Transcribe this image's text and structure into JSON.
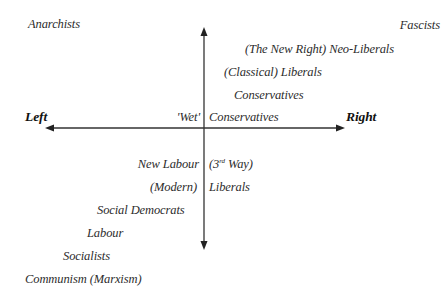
{
  "diagram": {
    "type": "political-spectrum-axes",
    "axes": {
      "horizontal": {
        "left_label": "Left",
        "right_label": "Right",
        "y": 128,
        "x_start": 45,
        "x_end": 345
      },
      "vertical": {
        "x": 204,
        "y_start": 27,
        "y_end": 250
      }
    },
    "corner_labels": {
      "top_left": "Anarchists",
      "top_right": "Fascists"
    },
    "right_side_labels": [
      {
        "text": "(The New Right) Neo-Liberals"
      },
      {
        "text": "(Classical) Liberals"
      },
      {
        "text": "Conservatives"
      }
    ],
    "center_labels": {
      "wet_left": "'Wet'",
      "wet_right": "Conservatives",
      "new_labour_left": "New Labour",
      "third_way_open": "(3",
      "third_way_sup": "rd",
      "third_way_close": " Way)",
      "modern_left": "(Modern)",
      "modern_right": "Liberals"
    },
    "left_side_labels": [
      {
        "text": "Social Democrats"
      },
      {
        "text": "Labour"
      },
      {
        "text": "Socialists"
      },
      {
        "text": "Communism (Marxism)"
      }
    ],
    "colors": {
      "axis": "#333333",
      "text": "#2c2c2c",
      "background": "#ffffff"
    }
  }
}
